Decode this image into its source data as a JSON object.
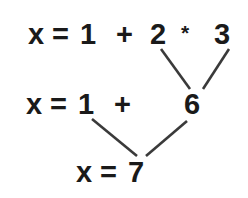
{
  "diagram": {
    "background_color": "#ffffff",
    "text_color": "#1a1a1a",
    "edge_color": "#3a3a3a",
    "rows": [
      {
        "id": "row-initial-expression",
        "label": "x = 1 + 2 * 3",
        "tokens": [
          {
            "id": "r1-x",
            "name": "variable-x",
            "text": "x",
            "x": 28,
            "y": 20
          },
          {
            "id": "r1-eq",
            "name": "equals-sign",
            "text": "=",
            "x": 52,
            "y": 20
          },
          {
            "id": "r1-one",
            "name": "operand-one",
            "text": "1",
            "x": 80,
            "y": 20
          },
          {
            "id": "r1-plus",
            "name": "operator-plus",
            "text": "+",
            "x": 116,
            "y": 20
          },
          {
            "id": "r1-two",
            "name": "operand-two",
            "text": "2",
            "x": 150,
            "y": 20
          },
          {
            "id": "r1-star",
            "name": "operator-multiply",
            "text": "*",
            "x": 181,
            "y": 22
          },
          {
            "id": "r1-three",
            "name": "operand-three",
            "text": "3",
            "x": 214,
            "y": 20
          }
        ]
      },
      {
        "id": "row-partial-expression",
        "label": "x = 1 + 6",
        "tokens": [
          {
            "id": "r2-x",
            "name": "variable-x",
            "text": "x",
            "x": 26,
            "y": 90
          },
          {
            "id": "r2-eq",
            "name": "equals-sign",
            "text": "=",
            "x": 50,
            "y": 90
          },
          {
            "id": "r2-one",
            "name": "operand-one",
            "text": "1",
            "x": 78,
            "y": 90
          },
          {
            "id": "r2-plus",
            "name": "operator-plus",
            "text": "+",
            "x": 114,
            "y": 90
          },
          {
            "id": "r2-six",
            "name": "operand-six",
            "text": "6",
            "x": 184,
            "y": 90
          }
        ]
      },
      {
        "id": "row-final-result",
        "label": "x = 7",
        "tokens": [
          {
            "id": "r3-x",
            "name": "variable-x",
            "text": "x",
            "x": 76,
            "y": 158
          },
          {
            "id": "r3-eq",
            "name": "equals-sign",
            "text": "=",
            "x": 100,
            "y": 158
          },
          {
            "id": "r3-seven",
            "name": "operand-seven",
            "text": "7",
            "x": 128,
            "y": 158
          }
        ]
      }
    ],
    "edges": [
      {
        "id": "edge-two-to-six",
        "name": "edge-operand-two-to-six",
        "x1": 161,
        "y1": 49,
        "x2": 190,
        "y2": 89
      },
      {
        "id": "edge-three-to-six",
        "name": "edge-operand-three-to-six",
        "x1": 229,
        "y1": 49,
        "x2": 203,
        "y2": 89
      },
      {
        "id": "edge-one-to-seven",
        "name": "edge-operand-one-to-seven",
        "x1": 92,
        "y1": 119,
        "x2": 137,
        "y2": 156
      },
      {
        "id": "edge-six-to-seven",
        "name": "edge-operand-six-to-seven",
        "x1": 187,
        "y1": 121,
        "x2": 146,
        "y2": 156
      }
    ]
  }
}
